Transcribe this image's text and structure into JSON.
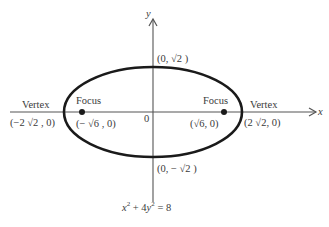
{
  "diagram": {
    "type": "ellipse",
    "equation": {
      "parts": [
        "x",
        "2",
        " + 4",
        "y",
        "2",
        " = 8"
      ],
      "text": "x² + 4y² = 8"
    },
    "axes": {
      "x_label": "x",
      "y_label": "y",
      "origin_label": "0"
    },
    "points": {
      "left_vertex": {
        "role": "Vertex",
        "coord": "(−2 √2 , 0)"
      },
      "right_vertex": {
        "role": "Vertex",
        "coord": "(2 √2, 0)"
      },
      "left_focus": {
        "role": "Focus",
        "coord": "(− √6 , 0)"
      },
      "right_focus": {
        "role": "Focus",
        "coord": "(√6, 0)"
      },
      "top_covertex": {
        "coord": "(0, √2 )"
      },
      "bottom_covertex": {
        "coord": "(0, − √2 )"
      }
    },
    "colors": {
      "curve": "#1a1a1a",
      "axis": "#555555",
      "text": "#3a3a3a"
    }
  }
}
